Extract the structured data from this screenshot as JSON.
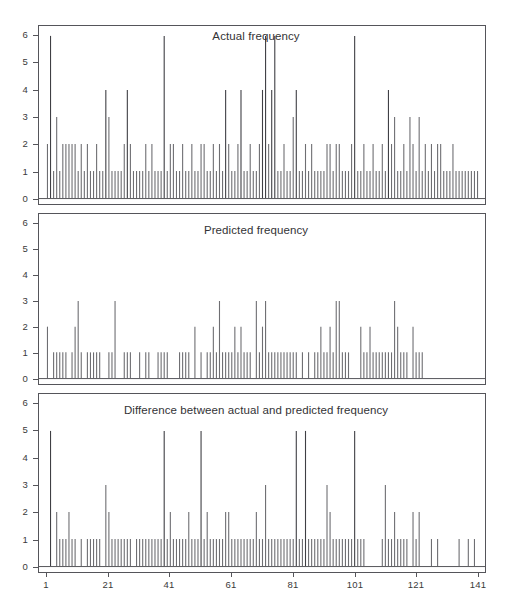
{
  "figure": {
    "width": 512,
    "height": 610,
    "background": "#ffffff",
    "axis_color": "#55555a",
    "spike_color": "#6e6e72"
  },
  "chart_data": [
    {
      "type": "bar",
      "title": "Actual frequency",
      "xlabel": "",
      "ylabel": "",
      "xlim": [
        1,
        141
      ],
      "ylim": [
        0,
        6
      ],
      "grid": false,
      "legend": "none",
      "xticks": [
        1,
        21,
        41,
        61,
        81,
        101,
        121,
        141
      ],
      "xtick_labels": [
        "1",
        "21",
        "41",
        "61",
        "81",
        "101",
        "121",
        "141"
      ],
      "yticks": [
        0,
        1,
        2,
        3,
        4,
        5,
        6
      ],
      "ytick_labels": [
        "0",
        "1",
        "2",
        "3",
        "4",
        "5",
        "6"
      ],
      "categories": [
        1,
        2,
        3,
        4,
        5,
        6,
        7,
        8,
        9,
        10,
        11,
        12,
        13,
        14,
        15,
        16,
        17,
        18,
        19,
        20,
        21,
        22,
        23,
        24,
        25,
        26,
        27,
        28,
        29,
        30,
        31,
        32,
        33,
        34,
        35,
        36,
        37,
        38,
        39,
        40,
        41,
        42,
        43,
        44,
        45,
        46,
        47,
        48,
        49,
        50,
        51,
        52,
        53,
        54,
        55,
        56,
        57,
        58,
        59,
        60,
        61,
        62,
        63,
        64,
        65,
        66,
        67,
        68,
        69,
        70,
        71,
        72,
        73,
        74,
        75,
        76,
        77,
        78,
        79,
        80,
        81,
        82,
        83,
        84,
        85,
        86,
        87,
        88,
        89,
        90,
        91,
        92,
        93,
        94,
        95,
        96,
        97,
        98,
        99,
        100,
        101,
        102,
        103,
        104,
        105,
        106,
        107,
        108,
        109,
        110,
        111,
        112,
        113,
        114,
        115,
        116,
        117,
        118,
        119,
        120,
        121,
        122,
        123,
        124,
        125,
        126,
        127,
        128,
        129,
        130,
        131,
        132,
        133,
        134,
        135,
        136,
        137,
        138,
        139,
        140,
        141
      ],
      "values": [
        2,
        6,
        1,
        3,
        1,
        2,
        2,
        2,
        2,
        2,
        1,
        2,
        1,
        2,
        1,
        1,
        2,
        1,
        1,
        4,
        3,
        1,
        1,
        1,
        1,
        2,
        4,
        2,
        1,
        1,
        1,
        1,
        2,
        1,
        2,
        1,
        1,
        1,
        6,
        1,
        2,
        2,
        1,
        1,
        2,
        1,
        1,
        2,
        1,
        1,
        2,
        2,
        1,
        1,
        2,
        1,
        2,
        1,
        4,
        2,
        1,
        1,
        2,
        4,
        1,
        1,
        2,
        1,
        1,
        2,
        4,
        6,
        2,
        4,
        6,
        1,
        1,
        2,
        1,
        1,
        3,
        4,
        1,
        1,
        2,
        1,
        2,
        1,
        1,
        1,
        1,
        2,
        2,
        1,
        2,
        2,
        1,
        1,
        1,
        2,
        6,
        1,
        1,
        2,
        1,
        1,
        2,
        1,
        1,
        2,
        1,
        4,
        2,
        3,
        1,
        1,
        2,
        1,
        3,
        2,
        1,
        3,
        1,
        2,
        1,
        2,
        1,
        2,
        2,
        1,
        1,
        1,
        2,
        1,
        1,
        1,
        1,
        1,
        1,
        1,
        1
      ]
    },
    {
      "type": "bar",
      "title": "Predicted frequency",
      "xlabel": "",
      "ylabel": "",
      "xlim": [
        1,
        141
      ],
      "ylim": [
        0,
        6
      ],
      "grid": false,
      "legend": "none",
      "xticks": [
        1,
        21,
        41,
        61,
        81,
        101,
        121,
        141
      ],
      "xtick_labels": [
        "1",
        "21",
        "41",
        "61",
        "81",
        "101",
        "121",
        "141"
      ],
      "yticks": [
        0,
        1,
        2,
        3,
        4,
        5,
        6
      ],
      "ytick_labels": [
        "0",
        "1",
        "2",
        "3",
        "4",
        "5",
        "6"
      ],
      "categories": [
        1,
        2,
        3,
        4,
        5,
        6,
        7,
        8,
        9,
        10,
        11,
        12,
        13,
        14,
        15,
        16,
        17,
        18,
        19,
        20,
        21,
        22,
        23,
        24,
        25,
        26,
        27,
        28,
        29,
        30,
        31,
        32,
        33,
        34,
        35,
        36,
        37,
        38,
        39,
        40,
        41,
        42,
        43,
        44,
        45,
        46,
        47,
        48,
        49,
        50,
        51,
        52,
        53,
        54,
        55,
        56,
        57,
        58,
        59,
        60,
        61,
        62,
        63,
        64,
        65,
        66,
        67,
        68,
        69,
        70,
        71,
        72,
        73,
        74,
        75,
        76,
        77,
        78,
        79,
        80,
        81,
        82,
        83,
        84,
        85,
        86,
        87,
        88,
        89,
        90,
        91,
        92,
        93,
        94,
        95,
        96,
        97,
        98,
        99,
        100,
        101,
        102,
        103,
        104,
        105,
        106,
        107,
        108,
        109,
        110,
        111,
        112,
        113,
        114,
        115,
        116,
        117,
        118,
        119,
        120,
        121,
        122,
        123,
        124,
        125,
        126,
        127,
        128,
        129,
        130,
        131,
        132,
        133,
        134,
        135,
        136,
        137,
        138,
        139,
        140,
        141
      ],
      "values": [
        2,
        0,
        1,
        1,
        1,
        1,
        1,
        0,
        1,
        2,
        3,
        1,
        0,
        1,
        1,
        1,
        1,
        1,
        0,
        0,
        1,
        1,
        3,
        0,
        0,
        1,
        1,
        1,
        0,
        0,
        1,
        0,
        1,
        1,
        0,
        0,
        1,
        1,
        1,
        1,
        0,
        0,
        0,
        1,
        1,
        1,
        1,
        0,
        2,
        0,
        1,
        0,
        1,
        1,
        2,
        1,
        3,
        1,
        1,
        1,
        1,
        2,
        1,
        2,
        1,
        1,
        1,
        0,
        3,
        1,
        2,
        3,
        1,
        1,
        1,
        1,
        1,
        1,
        1,
        1,
        1,
        1,
        0,
        1,
        0,
        1,
        0,
        1,
        1,
        2,
        1,
        1,
        2,
        1,
        3,
        3,
        1,
        1,
        1,
        0,
        0,
        0,
        2,
        1,
        1,
        2,
        1,
        1,
        1,
        1,
        1,
        1,
        1,
        3,
        2,
        1,
        1,
        1,
        0,
        2,
        1,
        1,
        1,
        0,
        0,
        0,
        0,
        0,
        0,
        0,
        0,
        0,
        0,
        0,
        0,
        0,
        0,
        0,
        0,
        0,
        0
      ]
    },
    {
      "type": "bar",
      "title": "Difference between actual and predicted frequency",
      "xlabel": "",
      "ylabel": "",
      "xlim": [
        1,
        141
      ],
      "ylim": [
        0,
        6
      ],
      "grid": false,
      "legend": "none",
      "xticks": [
        1,
        21,
        41,
        61,
        81,
        101,
        121,
        141
      ],
      "xtick_labels": [
        "1",
        "21",
        "41",
        "61",
        "81",
        "101",
        "121",
        "141"
      ],
      "yticks": [
        0,
        1,
        2,
        3,
        4,
        5,
        6
      ],
      "ytick_labels": [
        "0",
        "1",
        "2",
        "3",
        "4",
        "5",
        "6"
      ],
      "categories": [
        1,
        2,
        3,
        4,
        5,
        6,
        7,
        8,
        9,
        10,
        11,
        12,
        13,
        14,
        15,
        16,
        17,
        18,
        19,
        20,
        21,
        22,
        23,
        24,
        25,
        26,
        27,
        28,
        29,
        30,
        31,
        32,
        33,
        34,
        35,
        36,
        37,
        38,
        39,
        40,
        41,
        42,
        43,
        44,
        45,
        46,
        47,
        48,
        49,
        50,
        51,
        52,
        53,
        54,
        55,
        56,
        57,
        58,
        59,
        60,
        61,
        62,
        63,
        64,
        65,
        66,
        67,
        68,
        69,
        70,
        71,
        72,
        73,
        74,
        75,
        76,
        77,
        78,
        79,
        80,
        81,
        82,
        83,
        84,
        85,
        86,
        87,
        88,
        89,
        90,
        91,
        92,
        93,
        94,
        95,
        96,
        97,
        98,
        99,
        100,
        101,
        102,
        103,
        104,
        105,
        106,
        107,
        108,
        109,
        110,
        111,
        112,
        113,
        114,
        115,
        116,
        117,
        118,
        119,
        120,
        121,
        122,
        123,
        124,
        125,
        126,
        127,
        128,
        129,
        130,
        131,
        132,
        133,
        134,
        135,
        136,
        137,
        138,
        139,
        140,
        141
      ],
      "values": [
        0,
        5,
        0,
        2,
        1,
        1,
        1,
        2,
        1,
        1,
        0,
        1,
        0,
        1,
        1,
        1,
        1,
        1,
        0,
        3,
        2,
        1,
        1,
        1,
        1,
        1,
        1,
        1,
        0,
        1,
        1,
        1,
        1,
        1,
        1,
        1,
        1,
        1,
        5,
        1,
        2,
        1,
        1,
        1,
        1,
        1,
        2,
        1,
        1,
        1,
        5,
        1,
        2,
        1,
        1,
        1,
        1,
        1,
        2,
        2,
        1,
        1,
        1,
        1,
        1,
        1,
        1,
        1,
        2,
        1,
        1,
        3,
        1,
        1,
        1,
        1,
        1,
        1,
        1,
        1,
        1,
        5,
        1,
        1,
        5,
        1,
        1,
        1,
        1,
        1,
        1,
        3,
        2,
        1,
        1,
        1,
        1,
        1,
        1,
        1,
        5,
        1,
        1,
        1,
        0,
        0,
        0,
        0,
        0,
        1,
        3,
        1,
        1,
        2,
        1,
        1,
        1,
        1,
        0,
        2,
        1,
        2,
        0,
        0,
        0,
        1,
        0,
        1,
        0,
        0,
        0,
        0,
        0,
        0,
        1,
        0,
        0,
        1,
        0,
        1,
        0
      ]
    }
  ]
}
